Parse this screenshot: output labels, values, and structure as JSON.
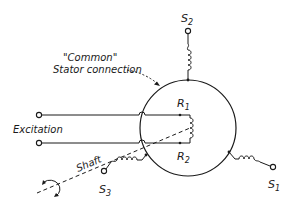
{
  "diagram": {
    "type": "synchro-schematic",
    "labels": {
      "common_line1": "\"Common\"",
      "common_line2": "Stator connection",
      "excitation": "Excitation",
      "shaft": "Shaft",
      "r1": "R",
      "r1_sub": "1",
      "r2": "R",
      "r2_sub": "2",
      "s1": "S",
      "s1_sub": "1",
      "s2": "S",
      "s2_sub": "2",
      "s3": "S",
      "s3_sub": "3"
    },
    "nodes": [
      {
        "id": "stator-circle",
        "shape": "circle"
      },
      {
        "id": "rotor-coil",
        "label": "R1-R2"
      },
      {
        "id": "stator-winding-s1",
        "label": "S1"
      },
      {
        "id": "stator-winding-s2",
        "label": "S2"
      },
      {
        "id": "stator-winding-s3",
        "label": "S3"
      },
      {
        "id": "excitation-terminals",
        "label": "Excitation"
      },
      {
        "id": "shaft",
        "label": "Shaft"
      }
    ],
    "edges": [
      {
        "from": "excitation-terminals",
        "to": "rotor-coil"
      },
      {
        "from": "stator-circle",
        "to": "stator-winding-s1"
      },
      {
        "from": "stator-circle",
        "to": "stator-winding-s2"
      },
      {
        "from": "stator-circle",
        "to": "stator-winding-s3"
      }
    ],
    "colors": {
      "ink": "#1a1a1a",
      "background": "#ffffff"
    }
  }
}
